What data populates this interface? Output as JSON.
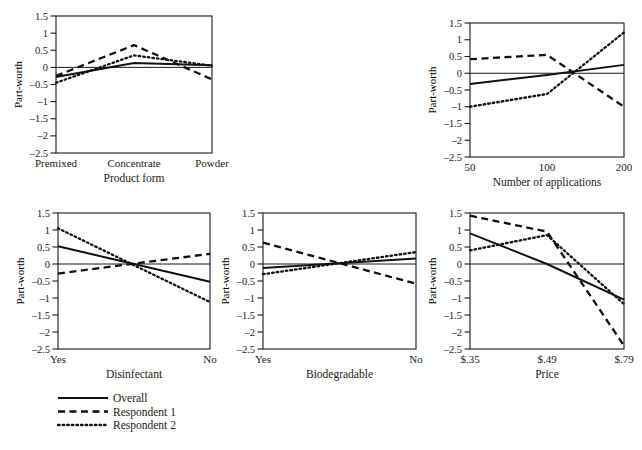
{
  "figure": {
    "background": "#ffffff",
    "ink": "#111111",
    "y_axis_label": "Part-worth",
    "y_ticks": [
      "1.5",
      "1",
      "0.5",
      "0",
      "‒0.5",
      "‒1",
      "‒1.5",
      "‒2",
      "‒2.5"
    ],
    "y_tick_values": [
      1.5,
      1,
      0.5,
      0,
      -0.5,
      -1,
      -1.5,
      -2,
      -2.5
    ],
    "ylim": [
      -2.5,
      1.5
    ]
  },
  "legend": {
    "items": [
      {
        "label": "Overall",
        "style": "solid"
      },
      {
        "label": "Respondent 1",
        "style": "dashed"
      },
      {
        "label": "Respondent 2",
        "style": "dotted"
      }
    ]
  },
  "chart_data": [
    {
      "id": "product-form",
      "type": "line",
      "title": "",
      "xlabel": "Product form",
      "ylabel": "Part-worth",
      "categories": [
        "Premixed",
        "Concentrate",
        "Powder"
      ],
      "x": [
        0,
        1,
        2
      ],
      "ylim": [
        -2.5,
        1.5
      ],
      "grid": false,
      "series": [
        {
          "name": "Overall",
          "style": "solid",
          "values": [
            -0.28,
            0.13,
            0.06
          ]
        },
        {
          "name": "Respondent 1",
          "style": "dashed",
          "values": [
            -0.25,
            0.65,
            -0.35
          ]
        },
        {
          "name": "Respondent 2",
          "style": "dotted",
          "values": [
            -0.45,
            0.35,
            0.05
          ]
        }
      ]
    },
    {
      "id": "number-of-applications",
      "type": "line",
      "title": "",
      "xlabel": "Number of applications",
      "ylabel": "Part-worth",
      "categories": [
        "50",
        "100",
        "200"
      ],
      "x": [
        0,
        1,
        2
      ],
      "ylim": [
        -2.5,
        1.5
      ],
      "grid": false,
      "series": [
        {
          "name": "Overall",
          "style": "solid",
          "values": [
            -0.32,
            -0.05,
            0.25
          ]
        },
        {
          "name": "Respondent 1",
          "style": "dashed",
          "values": [
            0.42,
            0.55,
            -1.0
          ]
        },
        {
          "name": "Respondent 2",
          "style": "dotted",
          "values": [
            -1.0,
            -0.62,
            1.22
          ]
        }
      ]
    },
    {
      "id": "disinfectant",
      "type": "line",
      "title": "",
      "xlabel": "Disinfectant",
      "ylabel": "Part-worth",
      "categories": [
        "Yes",
        "No"
      ],
      "x": [
        0,
        1
      ],
      "ylim": [
        -2.5,
        1.5
      ],
      "grid": false,
      "series": [
        {
          "name": "Overall",
          "style": "solid",
          "values": [
            0.52,
            -0.52
          ]
        },
        {
          "name": "Respondent 1",
          "style": "dashed",
          "values": [
            -0.28,
            0.3
          ]
        },
        {
          "name": "Respondent 2",
          "style": "dotted",
          "values": [
            1.05,
            -1.12
          ]
        }
      ]
    },
    {
      "id": "biodegradable",
      "type": "line",
      "title": "",
      "xlabel": "Biodegradable",
      "ylabel": "Part-worth",
      "categories": [
        "Yes",
        "No"
      ],
      "x": [
        0,
        1
      ],
      "ylim": [
        -2.5,
        1.5
      ],
      "grid": false,
      "series": [
        {
          "name": "Overall",
          "style": "solid",
          "values": [
            -0.12,
            0.16
          ]
        },
        {
          "name": "Respondent 1",
          "style": "dashed",
          "values": [
            0.63,
            -0.58
          ]
        },
        {
          "name": "Respondent 2",
          "style": "dotted",
          "values": [
            -0.3,
            0.35
          ]
        }
      ]
    },
    {
      "id": "price",
      "type": "line",
      "title": "",
      "xlabel": "Price",
      "ylabel": "Part-worth",
      "categories": [
        "$.35",
        "$.49",
        "$.79"
      ],
      "x": [
        0,
        1,
        2
      ],
      "ylim": [
        -2.5,
        1.5
      ],
      "grid": false,
      "series": [
        {
          "name": "Overall",
          "style": "solid",
          "values": [
            0.9,
            0.0,
            -1.05
          ]
        },
        {
          "name": "Respondent 1",
          "style": "dashed",
          "values": [
            1.42,
            0.95,
            -2.4
          ]
        },
        {
          "name": "Respondent 2",
          "style": "dotted",
          "values": [
            0.4,
            0.85,
            -1.18
          ]
        }
      ]
    }
  ]
}
